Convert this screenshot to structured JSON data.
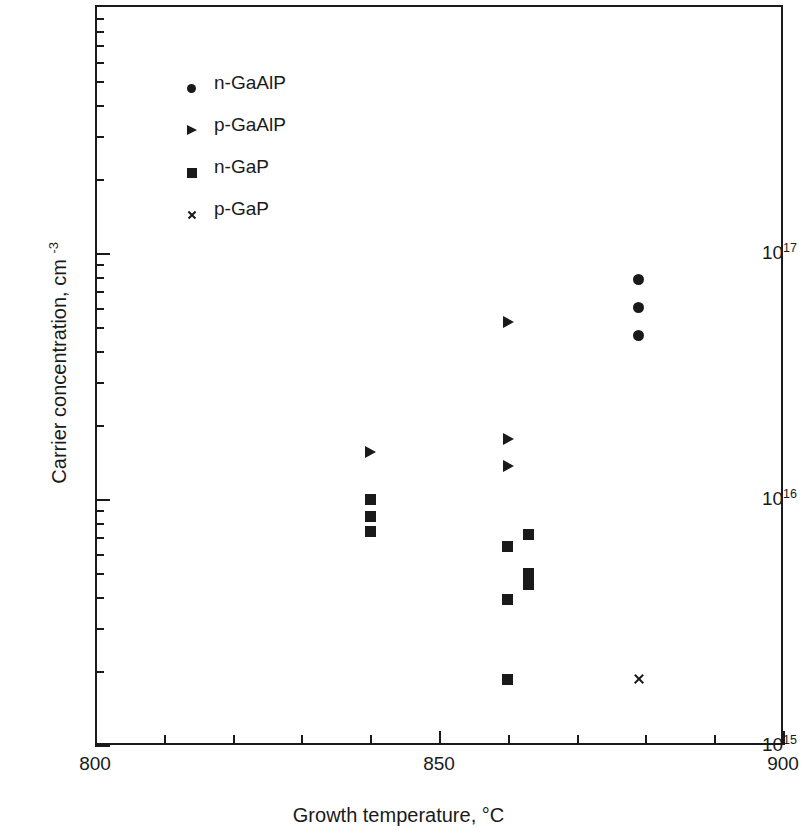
{
  "chart_data": {
    "type": "scatter",
    "title": "",
    "xlabel": "Growth temperature, °C",
    "ylabel": "Carrier concentration, cm −3",
    "xlim": [
      800,
      900
    ],
    "ylim": [
      1000000000000000.0,
      2.2e+17
    ],
    "yscale": "log",
    "xscale": "linear",
    "grid": false,
    "legend_position": "upper-left-inside",
    "x_tick_labels": [
      "800",
      "850",
      "900"
    ],
    "x_tick_values": [
      800,
      850,
      900
    ],
    "x_minor_tick_values": [
      810,
      820,
      830,
      840,
      860,
      870,
      880,
      890
    ],
    "y_tick_labels": [
      "10¹⁵",
      "10¹⁶",
      "10¹⁷"
    ],
    "y_tick_values": [
      1000000000000000.0,
      1e+16,
      1e+17
    ],
    "y_tick_mantissa": "10",
    "y_tick_exponents": [
      "15",
      "16",
      "17"
    ],
    "series": [
      {
        "name": "n-GaAlP",
        "marker": "circle",
        "color": "#1a1a1a",
        "points": [
          {
            "x": 879,
            "y": 7.8e+16
          },
          {
            "x": 879,
            "y": 6e+16
          },
          {
            "x": 879,
            "y": 4.6e+16
          }
        ]
      },
      {
        "name": "p-GaAlP",
        "marker": "triangle-right",
        "color": "#1a1a1a",
        "points": [
          {
            "x": 860,
            "y": 5.2e+16
          },
          {
            "x": 840,
            "y": 1.55e+16
          },
          {
            "x": 860,
            "y": 1.75e+16
          },
          {
            "x": 860,
            "y": 1.35e+16
          }
        ]
      },
      {
        "name": "n-GaP",
        "marker": "square",
        "color": "#1a1a1a",
        "points": [
          {
            "x": 840,
            "y": 1e+16
          },
          {
            "x": 840,
            "y": 8500000000000000.0
          },
          {
            "x": 840,
            "y": 7400000000000000.0
          },
          {
            "x": 860,
            "y": 6400000000000000.0
          },
          {
            "x": 863,
            "y": 7200000000000000.0
          },
          {
            "x": 863,
            "y": 5000000000000000.0
          },
          {
            "x": 863,
            "y": 4500000000000000.0
          },
          {
            "x": 860,
            "y": 3900000000000000.0
          },
          {
            "x": 860,
            "y": 1850000000000000.0
          }
        ]
      },
      {
        "name": "p-GaP",
        "marker": "cross",
        "color": "#1a1a1a",
        "points": [
          {
            "x": 879,
            "y": 1850000000000000.0
          }
        ]
      }
    ]
  },
  "legend": {
    "entries": [
      {
        "label": "n-GaAlP",
        "marker": "circle"
      },
      {
        "label": "p-GaAlP",
        "marker": "triangle-right"
      },
      {
        "label": "n-GaP",
        "marker": "square"
      },
      {
        "label": "p-GaP",
        "marker": "cross"
      }
    ]
  },
  "axes": {
    "x_title": "Growth temperature, °C",
    "y_title_main": "Carrier concentration, cm ",
    "y_title_sup": "-3"
  }
}
